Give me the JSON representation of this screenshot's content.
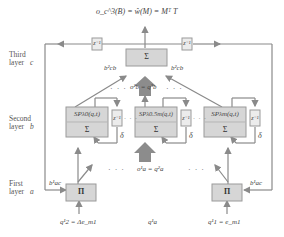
{
  "title": {
    "output_equation": "o_c^3(B) = ŵ(M) = Mᵀ T"
  },
  "layers": [
    {
      "name": "Third",
      "line2": "layer",
      "symbol": "c"
    },
    {
      "name": "Second",
      "line2": "layer",
      "symbol": "b"
    },
    {
      "name": "First",
      "line2": "layer",
      "symbol": "a"
    }
  ],
  "third_layer": {
    "node": "Σ",
    "weights_left": "b²cb",
    "weights_right": "b²cb",
    "delay_left": "z⁻¹",
    "delay_right": "z⁻¹"
  },
  "second_layer": {
    "link_equation": "o²b = q³b",
    "nodes": [
      {
        "sp": "SPλ0(q,t)",
        "sum": "Σ",
        "delay": "z⁻¹",
        "delta": "δ"
      },
      {
        "sp": "SPλ0.5m(q,t)",
        "sum": "Σ",
        "delay": "z⁻¹",
        "delta": "δ"
      },
      {
        "sp": "SPλm(q,t)",
        "sum": "Σ",
        "delay": "z⁻¹",
        "delta": "δ"
      }
    ]
  },
  "first_layer": {
    "link_equation": "o¹a = q²a",
    "nodes": [
      {
        "op": "Π",
        "weight": "b¹ac",
        "input": "q¹2 = Δe_m1"
      },
      {
        "op": "Π",
        "weight": "b¹ac",
        "input": "q¹1 = e_m1"
      }
    ],
    "middle_input": "q¹a"
  },
  "ellipsis": "· · ·",
  "colors": {
    "box_fill": "#d6d6d6",
    "box_stroke": "#9a9a9a",
    "line": "#8a8a8a",
    "big_arrow": "#8c8c8c"
  }
}
